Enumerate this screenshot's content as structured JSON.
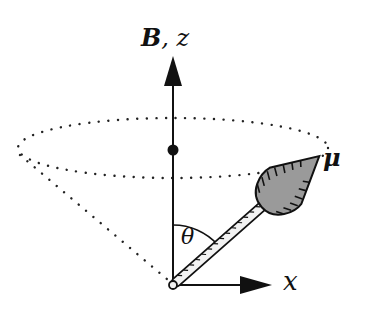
{
  "diagram": {
    "labels": {
      "field_axis": "B",
      "field_separator": ", ",
      "z_axis": "z",
      "x_axis": "x",
      "moment": "μ",
      "angle": "θ"
    },
    "elements": {
      "z_axis_arrow": {
        "from": [
          173,
          285
        ],
        "to": [
          173,
          60
        ]
      },
      "x_axis_arrow": {
        "from": [
          173,
          285
        ],
        "to": [
          270,
          285
        ]
      },
      "cone_ellipse": {
        "cx": 173,
        "cy": 148,
        "rx": 155,
        "ry": 30,
        "style": "dotted"
      },
      "cone_left_edge": {
        "from": [
          18,
          150
        ],
        "to": [
          173,
          285
        ],
        "style": "dotted"
      },
      "center_dot": {
        "cx": 173,
        "cy": 150,
        "r": 5
      },
      "moment_vector": {
        "from": [
          173,
          285
        ],
        "to": [
          318,
          157
        ]
      },
      "angle_arc": {
        "radius": 60
      }
    },
    "colors": {
      "ink": "#111111",
      "arrow_head_fill": "#9a9a9a",
      "background": "#ffffff"
    }
  }
}
